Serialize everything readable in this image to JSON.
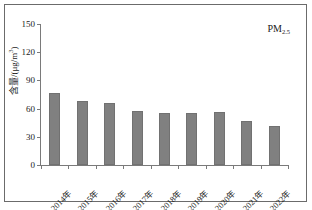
{
  "chart_data": {
    "type": "bar",
    "title": "",
    "xlabel": "",
    "ylabel": "含量/(μg/m³)",
    "ylabel_text": "含量/(μg/m",
    "ylabel_exp": "3",
    "ylabel_tail": ")",
    "categories": [
      "2014年",
      "2015年",
      "2016年",
      "2017年",
      "2018年",
      "2019年",
      "2020年",
      "2021年",
      "2022年"
    ],
    "values": [
      77,
      68,
      66,
      57,
      55,
      55,
      56,
      47,
      41
    ],
    "ylim": [
      0,
      150
    ],
    "yticks": [
      0,
      30,
      60,
      90,
      120,
      150
    ],
    "ytick_labels": [
      "0",
      "30",
      "60",
      "90",
      "120",
      "150"
    ],
    "grid": false,
    "legend_position": "top-right",
    "annotation": {
      "base": "PM",
      "subscript": "2.5"
    },
    "series": [
      {
        "name": "PM2.5",
        "color": "#808080",
        "values": [
          77,
          68,
          66,
          57,
          55,
          55,
          56,
          47,
          41
        ]
      }
    ]
  },
  "colors": {
    "bar": "#808080",
    "axis": "#7a7a7a",
    "frame": "#6b6b6b",
    "text": "#1a1a1a",
    "background": "#ffffff"
  }
}
